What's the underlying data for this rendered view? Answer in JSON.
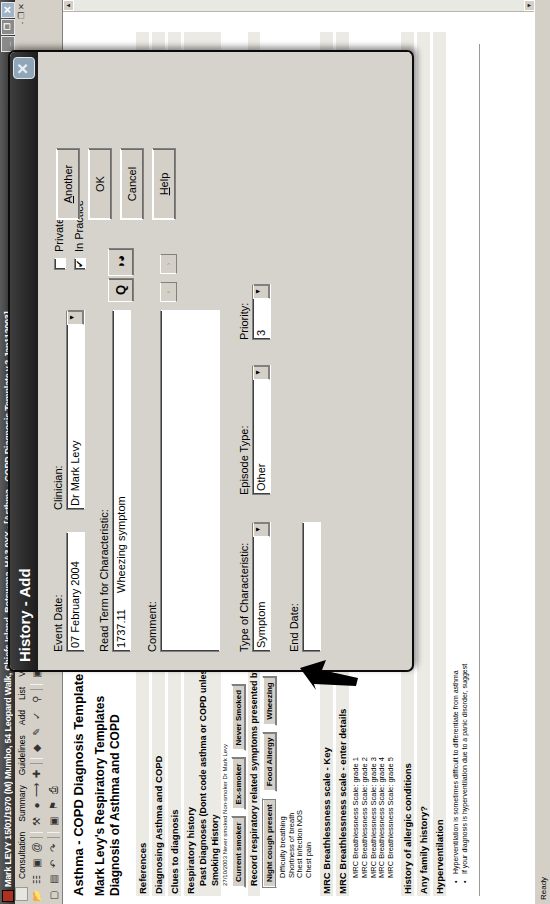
{
  "window": {
    "title": "Mark LEVY 15/01/1970 (M) Mumbo, 54 Leopard Walk, Chiefs Island, Botswana, HA3 0YX - [Asthma - COPD Diagnosis Template  v.2  Jan112003]",
    "minimize_label": "_",
    "restore_label": "❐",
    "close_label": "✕",
    "child_close_label": "✕",
    "child_minimize_label": "-",
    "child_restore_label": "❐"
  },
  "menu": {
    "items": [
      "Consultation",
      "Summary",
      "Guidelines",
      "Add",
      "List",
      "View",
      "Window",
      "Help"
    ]
  },
  "toolbar1": {
    "icons": [
      "folder-icon",
      "clipboard-icon",
      "calendar-icon",
      "at-icon",
      "prescription-icon",
      "pill-icon",
      "arrow-icon",
      "plus-icon",
      "diamond-icon",
      "pencil-icon",
      "spell-check-icon",
      "search-icon",
      "doc-icon",
      "grid-icon",
      "list-icon",
      "clock-icon",
      "paperclip-icon",
      "x-chart-icon",
      "scissors-icon",
      "note-icon",
      "square-icon",
      "ellipsis-icon",
      "circle-icon",
      "tag-icon",
      "printer-icon"
    ]
  },
  "toolbar2": {
    "icons": [
      "page-icon",
      "copy-icon",
      "undo-icon",
      "redo-icon",
      "window-icon",
      "tag2-icon",
      "printer2-icon"
    ]
  },
  "document": {
    "title": "Asthma - COPD Diagnosis Template  v.2  Jan112003",
    "subtitle_line1": "Mark Levy's Respiratory Templates",
    "subtitle_line2": "Diagnosis of Asthma and COPD",
    "sections": [
      {
        "label": "References"
      },
      {
        "label": "Diagnosing Asthma and COPD"
      },
      {
        "label": "Clues to diagnosis"
      },
      {
        "label": "Respiratory history"
      }
    ],
    "past_diagnoses_label": "Past Diagnoses (Dont code asthma or COPD unless confirmed.",
    "smoking_history_label": "Smoking History",
    "smoking_entry": "27/10/2003 Never smoked Non-smoker Dr Mark Levy",
    "smoking_buttons": [
      "Current smoker",
      "Ex-smoker",
      "Never Smoked"
    ],
    "record_symptoms_label": "Record respiratory related symptoms presented by the patient",
    "symptom_buttons": [
      "Night cough present",
      "Food Allergy",
      "Wheezing"
    ],
    "symptom_list": [
      "Difficulty breathing",
      "Shortness of breath",
      "Chest infection NOS",
      "Chest pain"
    ],
    "mrc_key_label": "MRC Breathlessness scale - Key",
    "mrc_enter_label": "MRC Breathlessness scale  - enter details",
    "mrc_grades": [
      "MRC Breathlessness Scale: grade 1",
      "MRC Breathlessness Scale: grade 2",
      "MRC Breathlessness Scale: grade 3",
      "MRC Breathlessness Scale: grade 4",
      "MRC Breathlessness Scale: grade 5"
    ],
    "allergic_label": "History of allergic conditions",
    "family_label": "Any family history?",
    "hyperventilation_label": "Hyperventilation",
    "hyperventilation_bullets": [
      "Hyperventilation is sometimes difficult to differentiate from asthma",
      "If your diagnosis is hyperventilation due to a panic disorder, suggest"
    ],
    "scroll_up_label": "▲",
    "scroll_down_label": "▼"
  },
  "dialog": {
    "title": "History - Add",
    "close_label": "✕",
    "event_date_label": "Event Date:",
    "event_date_value": "07 February 2004",
    "clinician_label": "Clinician:",
    "clinician_value": "Dr Mark Levy",
    "read_term_label": "Read Term for Characteristic:",
    "read_term_code": "1737.11",
    "read_term_value": "Wheezing symptom",
    "comment_label": "Comment:",
    "comment_value": "",
    "type_of_characteristic_label": "Type of Characteristic:",
    "type_of_characteristic_value": "Symptom",
    "episode_type_label": "Episode Type:",
    "episode_type_value": "Other",
    "end_date_label": "End Date:",
    "end_date_value": "",
    "priority_label": "Priority:",
    "priority_value": "3",
    "private_label": "Private",
    "private_checked": "",
    "in_practice_label": "In Practice",
    "in_practice_checked": "✔",
    "another_label": "Another",
    "ok_label": "OK",
    "cancel_label": "Cancel",
    "help_label": "Help",
    "search_icon_label": "Q",
    "glasses_icon_label": "◑◕",
    "nav_prev_label": "‹",
    "nav_next_label": "›",
    "combo_arrow_label": "▼"
  },
  "statusbar": {
    "text": "Ready"
  },
  "colors": {
    "titlebar_dark": "#2e2e2e",
    "dialog_face": "#d6d3cc",
    "toolbar_face": "#d4d0c8",
    "band": "#eceae4",
    "close_button": "#8fa6b8"
  }
}
